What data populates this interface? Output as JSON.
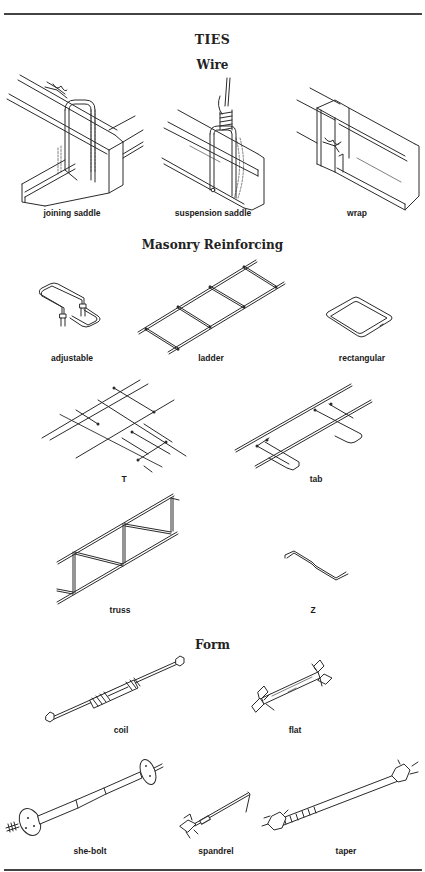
{
  "page": {
    "title": "TIES",
    "sections": [
      {
        "heading": "Wire",
        "items": [
          {
            "label": "joining saddle",
            "icon": "joining-saddle-illustration"
          },
          {
            "label": "suspension saddle",
            "icon": "suspension-saddle-illustration"
          },
          {
            "label": "wrap",
            "icon": "wrap-tie-illustration"
          }
        ]
      },
      {
        "heading": "Masonry Reinforcing",
        "items": [
          {
            "label": "adjustable",
            "icon": "adjustable-tie-illustration"
          },
          {
            "label": "ladder",
            "icon": "ladder-tie-illustration"
          },
          {
            "label": "rectangular",
            "icon": "rectangular-tie-illustration"
          },
          {
            "label": "T",
            "icon": "t-tie-illustration"
          },
          {
            "label": "tab",
            "icon": "tab-tie-illustration"
          },
          {
            "label": "truss",
            "icon": "truss-tie-illustration"
          },
          {
            "label": "Z",
            "icon": "z-tie-illustration"
          }
        ]
      },
      {
        "heading": "Form",
        "items": [
          {
            "label": "coil",
            "icon": "coil-tie-illustration"
          },
          {
            "label": "flat",
            "icon": "flat-tie-illustration"
          },
          {
            "label": "she-bolt",
            "icon": "she-bolt-illustration"
          },
          {
            "label": "spandrel",
            "icon": "spandrel-tie-illustration"
          },
          {
            "label": "taper",
            "icon": "taper-tie-illustration"
          }
        ]
      }
    ]
  },
  "colors": {
    "background": "#ffffff",
    "ink": "#222222",
    "rule": "#444444"
  }
}
